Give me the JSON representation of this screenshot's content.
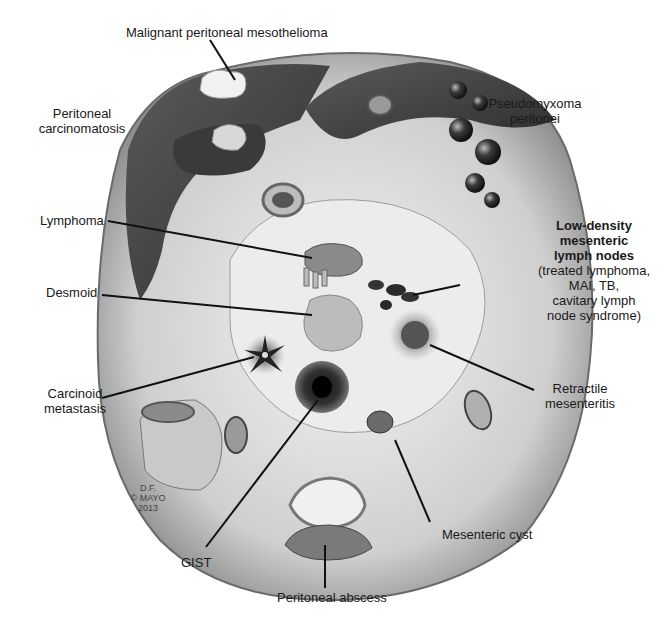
{
  "figure": {
    "credit": {
      "line1": "D.F.",
      "line2": "© MAYO",
      "line3": "2013"
    }
  },
  "labels": {
    "mesothelioma": "Malignant peritoneal mesothelioma",
    "carcinomatosis_1": "Peritoneal",
    "carcinomatosis_2": "carcinomatosis",
    "pseudomyxoma_1": "Pseudomyxoma",
    "pseudomyxoma_2": "peritonei",
    "lymphoma": "Lymphoma",
    "lowdensity_title_1": "Low-density",
    "lowdensity_title_2": "mesenteric",
    "lowdensity_title_3": "lymph nodes",
    "lowdensity_sub_1": "(treated lymphoma,",
    "lowdensity_sub_2": "MAI, TB,",
    "lowdensity_sub_3": "cavitary lymph",
    "lowdensity_sub_4": "node syndrome)",
    "desmoid": "Desmoid",
    "carcinoid_1": "Carcinoid",
    "carcinoid_2": "metastasis",
    "retractile_1": "Retractile",
    "retractile_2": "mesenteritis",
    "gist": "GIST",
    "mesenteric_cyst": "Mesenteric cyst",
    "abscess": "Peritoneal abscess"
  },
  "colors": {
    "background": "#ffffff",
    "cavity_light": "#e6e6e6",
    "cavity_mid": "#bdbdbd",
    "organ_dark": "#4a4a4a",
    "organ_darker": "#2e2e2e",
    "leader": "#111111"
  }
}
